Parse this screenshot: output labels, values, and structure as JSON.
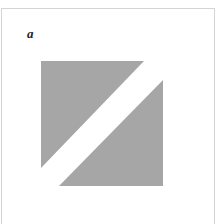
{
  "figure": {
    "panel_label": "a",
    "fill_color": "#a6a6a6",
    "background": "#ffffff",
    "shapes": [
      {
        "name": "upper-left-triangle",
        "points": "41,61 144,61 41,168"
      },
      {
        "name": "lower-right-triangle",
        "points": "163,80 163,186 59,186"
      }
    ]
  }
}
